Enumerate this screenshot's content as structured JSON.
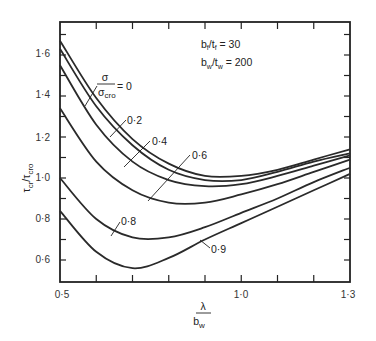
{
  "chart_data": {
    "type": "line",
    "title": "",
    "xlabel": "λ / b_w",
    "xlabel_num": "λ",
    "xlabel_den": "b",
    "xlabel_den_sub": "w",
    "ylabel": "τ_cr / τ_cro",
    "xlim": [
      0.5,
      1.3
    ],
    "ylim": [
      0.5,
      1.75
    ],
    "x_tick_labels": [
      "0.5",
      "1.0",
      "1.3"
    ],
    "x_ticks_display": [
      "0·5",
      "1·0",
      "1·3"
    ],
    "x_minor_ticks": [
      0.6,
      0.7,
      0.8,
      0.9,
      1.0,
      1.1,
      1.2
    ],
    "y_tick_labels": [
      "0.6",
      "0.8",
      "1.0",
      "1.2",
      "1.4",
      "1.6"
    ],
    "y_ticks_display": [
      "0·6",
      "0·8",
      "1·0",
      "1·2",
      "1·4",
      "1·6"
    ],
    "grid": false,
    "parameters": {
      "bf_tf": "b_f/t_f = 30",
      "bw_tw": "b_w/t_w = 200"
    },
    "legend_param": "σ / σ_cro",
    "series": [
      {
        "name": "σ/σcro = 0",
        "label": "= 0",
        "x": [
          0.5,
          0.6,
          0.7,
          0.8,
          0.9,
          1.0,
          1.1,
          1.2,
          1.3
        ],
        "values": [
          1.67,
          1.39,
          1.19,
          1.07,
          1.01,
          1.01,
          1.04,
          1.09,
          1.14
        ]
      },
      {
        "name": "σ/σcro = 0.2",
        "label": "0·2",
        "x": [
          0.5,
          0.6,
          0.7,
          0.8,
          0.9,
          1.0,
          1.1,
          1.2,
          1.3
        ],
        "values": [
          1.63,
          1.35,
          1.16,
          1.04,
          0.99,
          0.99,
          1.03,
          1.08,
          1.12
        ]
      },
      {
        "name": "σ/σcro = 0.4",
        "label": "0·4",
        "x": [
          0.5,
          0.6,
          0.7,
          0.8,
          0.9,
          1.0,
          1.1,
          1.2,
          1.3
        ],
        "values": [
          1.55,
          1.26,
          1.08,
          0.99,
          0.96,
          0.97,
          1.01,
          1.06,
          1.11
        ]
      },
      {
        "name": "σ/σcro = 0.6",
        "label": "0·6",
        "x": [
          0.5,
          0.6,
          0.7,
          0.8,
          0.9,
          1.0,
          1.1,
          1.2,
          1.3
        ],
        "values": [
          1.34,
          1.08,
          0.94,
          0.88,
          0.88,
          0.92,
          0.97,
          1.03,
          1.09
        ]
      },
      {
        "name": "σ/σcro = 0.8",
        "label": "0·8",
        "x": [
          0.5,
          0.6,
          0.7,
          0.8,
          0.9,
          1.0,
          1.1,
          1.2,
          1.3
        ],
        "values": [
          1.0,
          0.8,
          0.71,
          0.71,
          0.76,
          0.83,
          0.9,
          0.98,
          1.05
        ]
      },
      {
        "name": "σ/σcro = 0.9",
        "label": "0·9",
        "x": [
          0.5,
          0.6,
          0.7,
          0.8,
          0.9,
          1.0,
          1.1,
          1.2,
          1.3
        ],
        "values": [
          0.84,
          0.64,
          0.56,
          0.61,
          0.7,
          0.78,
          0.86,
          0.94,
          1.02
        ]
      }
    ]
  },
  "annotations": {
    "sigma": "σ",
    "sigma_cro": "σ",
    "cro_sub": "cro",
    "eq_zero": "= 0",
    "l02": "0·2",
    "l04": "0·4",
    "l06": "0·6",
    "l08": "0·8",
    "l09": "0·9",
    "bf_b": "b",
    "bf_f": "f",
    "bf_rest": "/t",
    "bf_val": " = 30",
    "bw_b": "b",
    "bw_w": "w",
    "bw_rest": "/t",
    "bw_val": " = 200",
    "ylab_tau": "τ",
    "ylab_cr": "cr",
    "ylab_slash": "/τ",
    "ylab_cro": "cro"
  }
}
